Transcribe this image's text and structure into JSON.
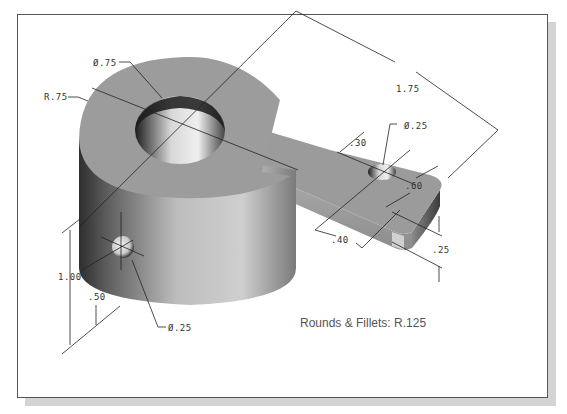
{
  "drawing": {
    "title": "Isometric part with dimensions",
    "background": "#ffffff",
    "frame_border": "#555555",
    "shadow_color": "#d4d4d4",
    "part_color": "#9a9a9a"
  },
  "dimensions": {
    "bore_diameter": "Ø.75",
    "outer_radius": "R.75",
    "arm_length": "1.75",
    "small_hole_diameter": "Ø.25",
    "small_hole_offset": ".30",
    "arm_width": ".60",
    "arm_offset": ".40",
    "arm_thickness": ".25",
    "total_height": "1.00",
    "side_hole_height": ".50",
    "side_hole_diameter": "Ø.25"
  },
  "notes": {
    "rounds_fillets": "Rounds & Fillets: R.125"
  }
}
